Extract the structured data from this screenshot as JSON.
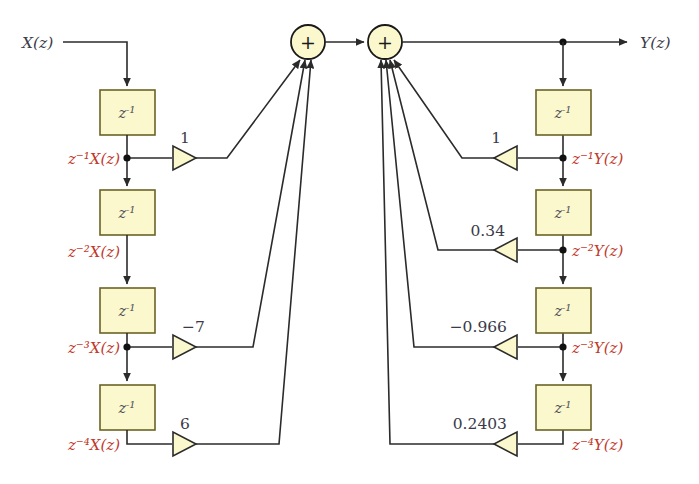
{
  "diagram": {
    "input_label": "X(z)",
    "output_label": "Y(z)",
    "adder_symbol": "+",
    "delay_block_label": "z⁻¹",
    "colors": {
      "block_fill": "#fbf8cd",
      "block_stroke": "#6b6326",
      "wire": "#2b2b2b",
      "signal_label": "#3a3a48",
      "tap_label": "#c0392b",
      "node_dot": "#111111"
    },
    "adders": [
      {
        "name": "feedforward-adder",
        "symbol": "+"
      },
      {
        "name": "feedback-adder",
        "symbol": "+"
      }
    ],
    "feedforward": {
      "column_label": "X(z) delay chain",
      "delay_blocks": [
        {
          "label": "z⁻¹"
        },
        {
          "label": "z⁻¹"
        },
        {
          "label": "z⁻¹"
        },
        {
          "label": "z⁻¹"
        }
      ],
      "taps": [
        {
          "signal": "z⁻¹X(z)",
          "gain": "1"
        },
        {
          "signal": "z⁻²X(z)",
          "gain": ""
        },
        {
          "signal": "z⁻³X(z)",
          "gain": "−7"
        },
        {
          "signal": "z⁻⁴X(z)",
          "gain": "6"
        }
      ]
    },
    "feedback": {
      "column_label": "Y(z) delay chain",
      "delay_blocks": [
        {
          "label": "z⁻¹"
        },
        {
          "label": "z⁻¹"
        },
        {
          "label": "z⁻¹"
        },
        {
          "label": "z⁻¹"
        }
      ],
      "taps": [
        {
          "signal": "z⁻¹Y(z)",
          "gain": "1"
        },
        {
          "signal": "z⁻²Y(z)",
          "gain": "0.34"
        },
        {
          "signal": "z⁻³Y(z)",
          "gain": "−0.966"
        },
        {
          "signal": "z⁻⁴Y(z)",
          "gain": "0.2403"
        }
      ]
    }
  }
}
